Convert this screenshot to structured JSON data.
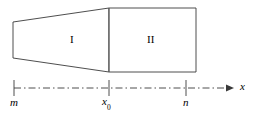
{
  "figure": {
    "title": "",
    "type": "geometry-diagram",
    "background_color": "#ffffff",
    "stroke_color": "#3a3a3a",
    "axis_color": "#3a3a3a",
    "width": 254,
    "height": 115
  },
  "regions": [
    {
      "id": "region-1",
      "label": "I",
      "shape": "trapezoid",
      "vertices": [
        [
          13,
          22
        ],
        [
          109,
          8
        ],
        [
          109,
          72
        ],
        [
          13,
          58
        ]
      ],
      "label_position": [
        70,
        34
      ]
    },
    {
      "id": "region-2",
      "label": "II",
      "shape": "rectangle",
      "vertices": [
        [
          109,
          8
        ],
        [
          196,
          8
        ],
        [
          196,
          72
        ],
        [
          109,
          72
        ]
      ],
      "label_position": [
        147,
        34
      ]
    }
  ],
  "divider": {
    "name": "region-divider-line",
    "from": [
      109,
      8
    ],
    "to": [
      109,
      72
    ]
  },
  "axis": {
    "name": "x-axis",
    "style": "dash-dot",
    "from": [
      14,
      88
    ],
    "to": [
      232,
      88
    ],
    "arrow": true,
    "label": "x",
    "ticks": [
      {
        "id": "tick-m",
        "x": 14,
        "label": "m",
        "subscript": ""
      },
      {
        "id": "tick-x0",
        "x": 109,
        "label": "x",
        "subscript": "0"
      },
      {
        "id": "tick-n",
        "x": 186,
        "label": "n",
        "subscript": ""
      }
    ]
  }
}
